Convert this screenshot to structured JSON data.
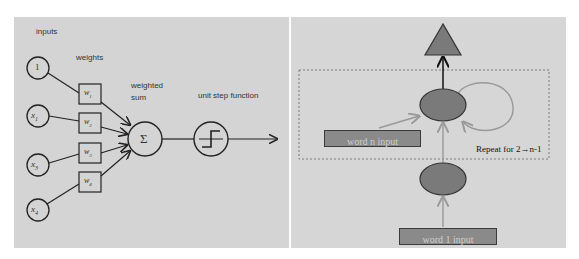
{
  "left_diagram": {
    "title": "perceptron",
    "labels": {
      "inputs": "inputs",
      "weights": "weights",
      "weighted_sum": [
        "weighted",
        "sum"
      ],
      "activation": "unit step function",
      "sum_symbol": "Σ"
    },
    "inputs": [
      "1",
      "x1",
      "x2",
      "x3"
    ],
    "input_display": [
      "1",
      "x",
      "x",
      "x"
    ],
    "input_subscripts": [
      "",
      "1",
      "3",
      "4"
    ],
    "weights": [
      "w",
      "w",
      "w",
      "w"
    ],
    "weight_subscripts": [
      "1",
      "2",
      "3",
      "4"
    ]
  },
  "right_diagram": {
    "title": "recurrent network",
    "boxes": {
      "word_n": "word n input",
      "word_1": "word 1 input"
    },
    "repeat_label": "Repeat for 2→n-1",
    "colors": {
      "node_fill": "#7a7a7a",
      "box_fill": "#8a8a8a",
      "box_border": "#3a3a3a",
      "arrow_gray": "#999999",
      "dashed_border": "#666666"
    }
  }
}
